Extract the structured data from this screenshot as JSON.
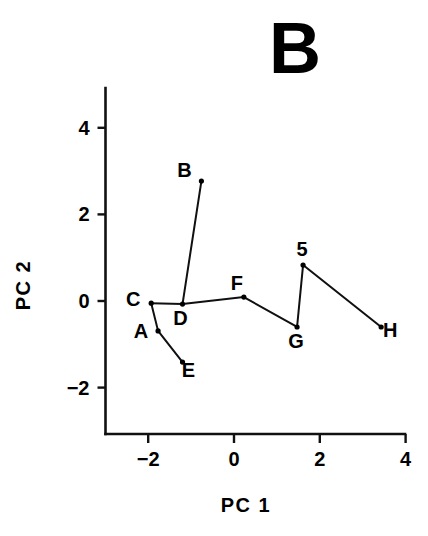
{
  "chart_data": {
    "type": "scatter",
    "title": "B",
    "xlabel": "PC  1",
    "ylabel": "PC  2",
    "xlim": [
      -3.0,
      4.0
    ],
    "ylim": [
      -3.1,
      4.9
    ],
    "grid": false,
    "legend": null,
    "xticks": [
      {
        "value": -2,
        "label": "−2"
      },
      {
        "value": 0,
        "label": "0"
      },
      {
        "value": 2,
        "label": "2"
      },
      {
        "value": 4,
        "label": "4"
      }
    ],
    "yticks": [
      {
        "value": -2,
        "label": "−2"
      },
      {
        "value": 0,
        "label": "0"
      },
      {
        "value": 2,
        "label": "2"
      },
      {
        "value": 4,
        "label": "4"
      }
    ],
    "points": [
      {
        "label": "A",
        "x": -1.77,
        "y": -0.69,
        "label_dx": -17,
        "label_dy": 7
      },
      {
        "label": "B",
        "x": -0.76,
        "y": 2.77,
        "label_dx": -17,
        "label_dy": -4
      },
      {
        "label": "C",
        "x": -1.93,
        "y": -0.05,
        "label_dx": -18,
        "label_dy": 3
      },
      {
        "label": "D",
        "x": -1.2,
        "y": -0.07,
        "label_dx": -2,
        "label_dy": 21
      },
      {
        "label": "E",
        "x": -1.2,
        "y": -1.41,
        "label_dx": 6,
        "label_dy": 15
      },
      {
        "label": "F",
        "x": 0.23,
        "y": 0.09,
        "label_dx": -7,
        "label_dy": -7
      },
      {
        "label": "G",
        "x": 1.47,
        "y": -0.6,
        "label_dx": -1,
        "label_dy": 21
      },
      {
        "label": "H",
        "x": 3.43,
        "y": -0.6,
        "label_dx": 9,
        "label_dy": 10
      },
      {
        "label": "5",
        "x": 1.61,
        "y": 0.83,
        "label_dx": -1,
        "label_dy": -9
      }
    ],
    "connections": [
      [
        "C",
        "A"
      ],
      [
        "C",
        "D"
      ],
      [
        "A",
        "E"
      ],
      [
        "D",
        "B"
      ],
      [
        "D",
        "F"
      ],
      [
        "F",
        "G"
      ],
      [
        "G",
        "5"
      ],
      [
        "5",
        "H"
      ]
    ]
  },
  "colors": {
    "ink": "#000000",
    "axis": "#111111",
    "background": "#ffffff"
  }
}
